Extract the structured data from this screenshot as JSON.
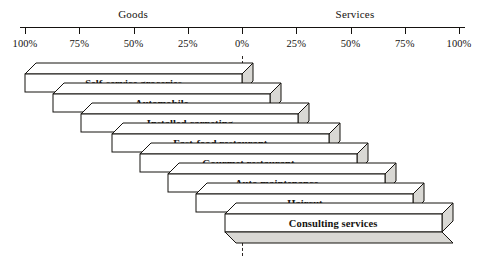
{
  "chart_data": {
    "type": "bar",
    "title": "",
    "subtitle": "",
    "xlabel": "",
    "ylabel": "",
    "orientation": "horizontal",
    "style": "3d-staircase-continuum",
    "grid": false,
    "legend_position": "none",
    "axis": {
      "left_heading": "Goods",
      "right_heading": "Services",
      "tick_labels": [
        "100%",
        "75%",
        "50%",
        "25%",
        "0%",
        "25%",
        "50%",
        "75%",
        "100%"
      ],
      "tick_values": [
        -100,
        -75,
        -50,
        -25,
        0,
        25,
        50,
        75,
        100
      ],
      "xlim": [
        -100,
        100
      ],
      "zero_label": "0%",
      "zero_marker": "dashed-line"
    },
    "categories": [
      "Self-service groceries",
      "Automobile",
      "Installed carpeting",
      "Fast-food restaurant",
      "Gourmet restaurant",
      "Auto maintenance",
      "Haircut",
      "Consulting services"
    ],
    "series": [
      {
        "name": "Goods percentage",
        "values": [
          100,
          87,
          74,
          60,
          47,
          34,
          21,
          8
        ]
      },
      {
        "name": "Services percentage",
        "values": [
          0,
          13,
          26,
          40,
          53,
          66,
          79,
          92
        ]
      }
    ],
    "bars": [
      {
        "label": "Self-service groceries",
        "goods": 100,
        "services": 0,
        "start_pct": -100,
        "end_pct": 0
      },
      {
        "label": "Automobile",
        "goods": 87,
        "services": 13,
        "start_pct": -87,
        "end_pct": 13
      },
      {
        "label": "Installed carpeting",
        "goods": 74,
        "services": 26,
        "start_pct": -74,
        "end_pct": 26
      },
      {
        "label": "Fast-food restaurant",
        "goods": 60,
        "services": 40,
        "start_pct": -60,
        "end_pct": 40
      },
      {
        "label": "Gourmet restaurant",
        "goods": 47,
        "services": 53,
        "start_pct": -47,
        "end_pct": 53
      },
      {
        "label": "Auto maintenance",
        "goods": 34,
        "services": 66,
        "start_pct": -34,
        "end_pct": 66
      },
      {
        "label": "Haircut",
        "goods": 21,
        "services": 79,
        "start_pct": -21,
        "end_pct": 79
      },
      {
        "label": "Consulting services",
        "goods": 8,
        "services": 92,
        "start_pct": -8,
        "end_pct": 92
      }
    ],
    "colors": {
      "bar_face": "#ffffff",
      "bar_shade": "#d9d8d4",
      "bar_outline": "#15120f",
      "axis": "#15120f",
      "text": "#15120f",
      "background": "#ffffff"
    }
  }
}
